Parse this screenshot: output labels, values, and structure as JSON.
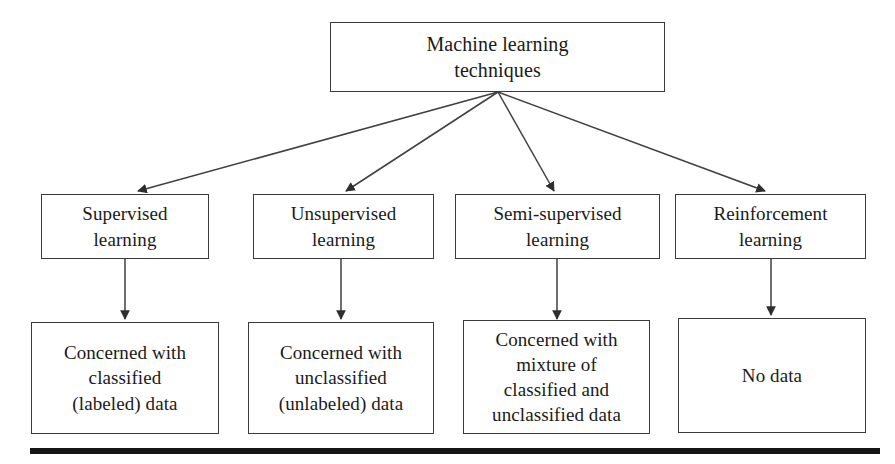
{
  "diagram": {
    "title_node": {
      "label": "Machine learning\ntechniques"
    },
    "categories": [
      {
        "label": "Supervised\nlearning"
      },
      {
        "label": "Unsupervised\nlearning"
      },
      {
        "label": "Semi-supervised\nlearning"
      },
      {
        "label": "Reinforcement\nlearning"
      }
    ],
    "descriptions": [
      {
        "label": "Concerned with\nclassified\n(labeled) data"
      },
      {
        "label": "Concerned with\nunclassified\n(unlabeled) data"
      },
      {
        "label": "Concerned with\nmixture of\nclassified and\nunclassified data"
      },
      {
        "label": "No data"
      }
    ],
    "colors": {
      "box_border": "#3a3a3a",
      "connector": "#404040",
      "rule": "#151515",
      "text": "#1a1a1a",
      "background": "#ffffff"
    }
  }
}
